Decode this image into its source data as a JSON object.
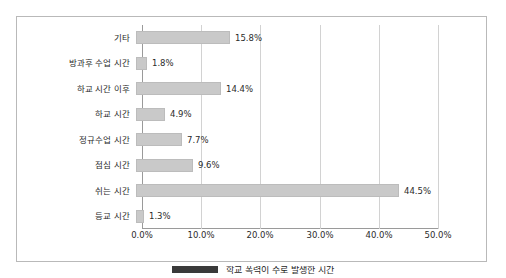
{
  "chart_data": {
    "type": "bar",
    "orientation": "horizontal",
    "title": "",
    "xlabel": "",
    "ylabel": "",
    "xlim": [
      0,
      50
    ],
    "grid": true,
    "categories": [
      "기타",
      "방과후 수업 시간",
      "하교 시간 이후",
      "하교 시간",
      "정규수업 시간",
      "점심 시간",
      "쉬는 시간",
      "등교 시간"
    ],
    "values": [
      15.8,
      1.8,
      14.4,
      4.9,
      7.7,
      9.6,
      44.5,
      1.3
    ],
    "data_labels": [
      "15.8%",
      "1.8%",
      "14.4%",
      "4.9%",
      "7.7%",
      "9.6%",
      "44.5%",
      "1.3%"
    ],
    "xticks": [
      0,
      10,
      20,
      30,
      40,
      50
    ],
    "xtick_labels": [
      "0.0%",
      "10.0%",
      "20.0%",
      "30.0%",
      "40.0%",
      "50.0%"
    ],
    "bar_color": "#c9c9c9",
    "grid_color": "#d2d2d2",
    "axis_color": "#9a9a9a",
    "frame_color": "#b9b9b9",
    "legend": {
      "position": "bottom",
      "swatch_color": "#3a3a3a",
      "label": "학교 폭력이 주로 발생한 시간"
    }
  }
}
